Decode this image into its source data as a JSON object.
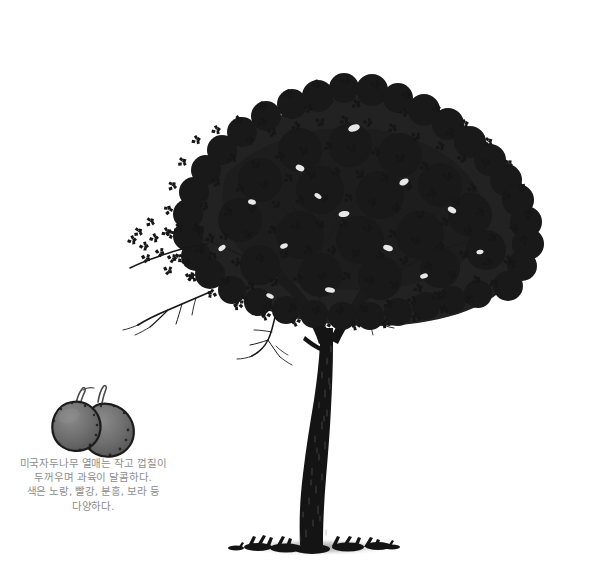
{
  "page": {
    "background_color": "#ffffff",
    "width": 604,
    "height": 586
  },
  "illustration": {
    "name": "american-plum-tree-ink-illustration",
    "style": "pen-and-ink stipple drawing, black on white",
    "ink_color": "#1a1a1a",
    "shadow_color": "#9a9a9a",
    "subject": "American plum tree with dense rounded canopy, forked trunk, bare lower twigs and ground shadow",
    "canopy": {
      "left": 128,
      "right": 568,
      "top": 58,
      "bottom": 330
    },
    "trunk": {
      "top": 300,
      "base_y": 545,
      "fork_y": 330
    }
  },
  "fruit": {
    "name": "plum-fruit-pair",
    "count": 2,
    "fill_color": "#6e6e6e",
    "outline_color": "#1f1f1f",
    "stem_color": "#555555",
    "left": 45,
    "top": 386,
    "width": 92,
    "height": 62
  },
  "caption": {
    "text_color": "#8d8d8d",
    "align": "center",
    "lines": [
      "미국자두나무 열매는 작고 껍질이",
      "두꺼우며 과육이 달콤하다.",
      "색은 노랑, 빨강, 분홍, 보라 등",
      "다양하다."
    ]
  }
}
